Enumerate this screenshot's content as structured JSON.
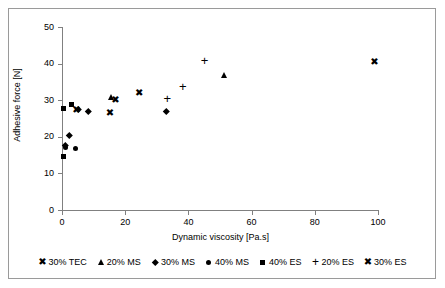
{
  "figure": {
    "background": "#ffffff",
    "frame_color": "#9a9a9a",
    "axis_color": "#808080",
    "marker_color": "#000000"
  },
  "chart_data": {
    "type": "scatter",
    "title": "",
    "xlabel": "Dynamic viscosity [Pa.s]",
    "ylabel": "Adhesive force  [N]",
    "xlim": [
      0,
      100
    ],
    "ylim": [
      0,
      50
    ],
    "xticks": [
      0,
      20,
      40,
      60,
      80,
      100
    ],
    "yticks": [
      0,
      10,
      20,
      30,
      40,
      50
    ],
    "grid": false,
    "legend_position": "bottom",
    "series": [
      {
        "name": "30% TEC",
        "marker": "x",
        "points": [
          {
            "x": 4.6,
            "y": 27.3
          },
          {
            "x": 15.2,
            "y": 26.3
          },
          {
            "x": 16.9,
            "y": 29.8
          },
          {
            "x": 24.4,
            "y": 31.7
          }
        ]
      },
      {
        "name": "20% MS",
        "marker": "triangle",
        "points": [
          {
            "x": 15.6,
            "y": 30.6
          },
          {
            "x": 51.6,
            "y": 36.7
          }
        ]
      },
      {
        "name": "30% MS",
        "marker": "diamond",
        "points": [
          {
            "x": 1.1,
            "y": 17.6
          },
          {
            "x": 2.4,
            "y": 20.5
          },
          {
            "x": 5.3,
            "y": 27.5
          },
          {
            "x": 8.4,
            "y": 27.1
          },
          {
            "x": 33.0,
            "y": 26.9
          }
        ]
      },
      {
        "name": "40% MS",
        "marker": "circle",
        "points": [
          {
            "x": 1.0,
            "y": 17.0
          },
          {
            "x": 4.2,
            "y": 16.9
          }
        ]
      },
      {
        "name": "40% ES",
        "marker": "square",
        "points": [
          {
            "x": 0.5,
            "y": 14.5
          },
          {
            "x": 0.6,
            "y": 27.6
          },
          {
            "x": 3.0,
            "y": 28.7
          }
        ]
      },
      {
        "name": "20% ES",
        "marker": "plus",
        "points": [
          {
            "x": 33.3,
            "y": 30.3
          },
          {
            "x": 38.2,
            "y": 33.6
          },
          {
            "x": 45.1,
            "y": 40.6
          }
        ]
      },
      {
        "name": "30% ES",
        "marker": "x",
        "points": [
          {
            "x": 98.9,
            "y": 40.3
          }
        ]
      }
    ]
  },
  "axes": {
    "y_tick_labels": [
      "50",
      "40",
      "30",
      "20",
      "10",
      "0"
    ],
    "x_tick_labels": [
      "0",
      "20",
      "40",
      "60",
      "80",
      "100"
    ],
    "y_axis_title": "Adhesive force  [N]",
    "x_axis_title": "Dynamic viscosity [Pa.s]"
  },
  "legend": {
    "items": [
      {
        "label": "30% TEC",
        "marker": "x",
        "glyph": "✖"
      },
      {
        "label": "20% MS",
        "marker": "triangle",
        "glyph": ""
      },
      {
        "label": "30% MS",
        "marker": "diamond",
        "glyph": ""
      },
      {
        "label": "40% MS",
        "marker": "circle",
        "glyph": ""
      },
      {
        "label": "40% ES",
        "marker": "square",
        "glyph": ""
      },
      {
        "label": "20% ES",
        "marker": "plus",
        "glyph": "+"
      },
      {
        "label": "30% ES",
        "marker": "x",
        "glyph": "✖"
      }
    ]
  }
}
